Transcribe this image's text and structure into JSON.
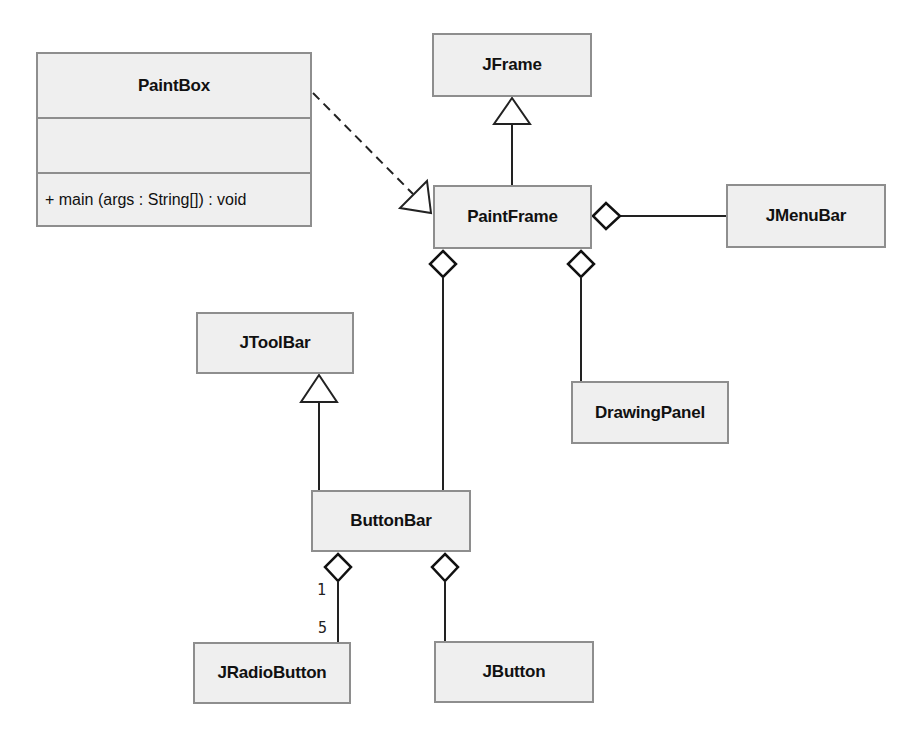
{
  "diagram": {
    "type": "UML class diagram",
    "classes": {
      "paintbox": {
        "name": "PaintBox",
        "attributes": [],
        "operations": [
          "+ main (args : String[]) : void"
        ]
      },
      "jframe": {
        "name": "JFrame"
      },
      "paintframe": {
        "name": "PaintFrame"
      },
      "jmenubar": {
        "name": "JMenuBar"
      },
      "jtoolbar": {
        "name": "JToolBar"
      },
      "drawingpanel": {
        "name": "DrawingPanel"
      },
      "buttonbar": {
        "name": "ButtonBar"
      },
      "jradiobutton": {
        "name": "JRadioButton"
      },
      "jbutton": {
        "name": "JButton"
      }
    },
    "relationships": [
      {
        "type": "dependency-realization",
        "from": "PaintBox",
        "to": "PaintFrame",
        "style": "dashed",
        "head": "hollow-triangle"
      },
      {
        "type": "generalization",
        "from": "PaintFrame",
        "to": "JFrame",
        "head": "hollow-triangle"
      },
      {
        "type": "aggregation",
        "whole": "PaintFrame",
        "part": "JMenuBar",
        "head": "hollow-diamond"
      },
      {
        "type": "aggregation",
        "whole": "PaintFrame",
        "part": "ButtonBar",
        "head": "hollow-diamond"
      },
      {
        "type": "aggregation",
        "whole": "PaintFrame",
        "part": "DrawingPanel",
        "head": "hollow-diamond"
      },
      {
        "type": "generalization",
        "from": "ButtonBar",
        "to": "JToolBar",
        "head": "hollow-triangle"
      },
      {
        "type": "aggregation",
        "whole": "ButtonBar",
        "part": "JRadioButton",
        "head": "hollow-diamond",
        "whole_multiplicity": "1",
        "part_multiplicity": "5"
      },
      {
        "type": "aggregation",
        "whole": "ButtonBar",
        "part": "JButton",
        "head": "hollow-diamond"
      }
    ],
    "multiplicities": {
      "buttonbar_end": "1",
      "jradiobutton_end": "5"
    },
    "colors": {
      "box_fill": "#efefef",
      "box_border": "#8e8e8e",
      "line": "#222222"
    }
  }
}
